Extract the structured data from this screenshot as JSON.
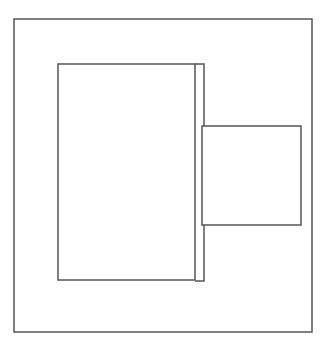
{
  "diagram": {
    "background": "#ffffff",
    "stroke_color": "#555555",
    "stroke_width": 1.5,
    "shapes": {
      "outer_frame": {
        "x1": 14,
        "y1": 19,
        "x2": 312,
        "y2": 332
      },
      "main_rect": {
        "x1": 58,
        "y1": 64,
        "x2": 195,
        "y2": 280
      },
      "side_strip": {
        "x1": 195,
        "y1": 64,
        "x2": 204,
        "y2": 281
      },
      "attached_box": {
        "x1": 202,
        "y1": 126,
        "x2": 301,
        "y2": 225
      }
    }
  }
}
